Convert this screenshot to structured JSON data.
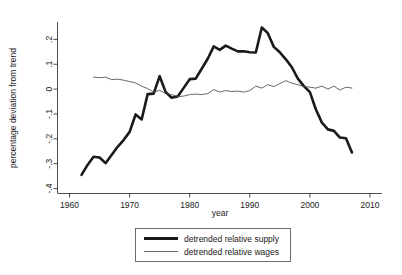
{
  "chart_data": {
    "type": "line",
    "title": "",
    "xlabel": "year",
    "ylabel": "percentage deviation from trend",
    "xlim": [
      1958,
      2012
    ],
    "ylim": [
      -0.42,
      0.27
    ],
    "xticks": [
      1960,
      1970,
      1980,
      1990,
      2000,
      2010
    ],
    "xtick_labels": [
      "1960",
      "1970",
      "1980",
      "1990",
      "2000",
      "2010"
    ],
    "yticks": [
      0.2,
      0.1,
      0,
      -0.1,
      -0.2,
      -0.3,
      -0.4
    ],
    "ytick_labels": [
      ".2",
      ".1",
      "0",
      "-.1",
      "-.2",
      "-.3",
      "-.4"
    ],
    "grid": false,
    "legend_position": "below",
    "series": [
      {
        "name": "detrended relative supply",
        "style": "thick",
        "color": "#1a1a1a",
        "x": [
          1962,
          1963,
          1964,
          1965,
          1966,
          1967,
          1968,
          1969,
          1970,
          1971,
          1972,
          1973,
          1974,
          1975,
          1976,
          1977,
          1978,
          1979,
          1980,
          1981,
          1982,
          1983,
          1984,
          1985,
          1986,
          1987,
          1988,
          1989,
          1990,
          1991,
          1992,
          1993,
          1994,
          1995,
          1996,
          1997,
          1998,
          1999,
          2000,
          2001,
          2002,
          2003,
          2004,
          2005,
          2006,
          2007
        ],
        "values": [
          -0.345,
          -0.305,
          -0.272,
          -0.275,
          -0.298,
          -0.265,
          -0.232,
          -0.205,
          -0.172,
          -0.102,
          -0.122,
          -0.02,
          -0.018,
          0.052,
          -0.012,
          -0.035,
          -0.03,
          0.005,
          0.04,
          0.042,
          0.082,
          0.122,
          0.172,
          0.158,
          0.175,
          0.163,
          0.152,
          0.152,
          0.148,
          0.147,
          0.248,
          0.225,
          0.17,
          0.148,
          0.12,
          0.088,
          0.042,
          0.012,
          -0.012,
          -0.082,
          -0.135,
          -0.162,
          -0.168,
          -0.195,
          -0.198,
          -0.255
        ]
      },
      {
        "name": "detrended relative wages",
        "style": "thin",
        "color": "#4a4a4a",
        "x": [
          1964,
          1965,
          1966,
          1967,
          1968,
          1969,
          1970,
          1971,
          1972,
          1973,
          1974,
          1975,
          1976,
          1977,
          1978,
          1979,
          1980,
          1981,
          1982,
          1983,
          1984,
          1985,
          1986,
          1987,
          1988,
          1989,
          1990,
          1991,
          1992,
          1993,
          1994,
          1995,
          1996,
          1997,
          1998,
          1999,
          2000,
          2001,
          2002,
          2003,
          2004,
          2005,
          2006,
          2007
        ],
        "values": [
          0.048,
          0.046,
          0.048,
          0.038,
          0.04,
          0.036,
          0.03,
          0.025,
          0.012,
          0.002,
          -0.012,
          -0.005,
          -0.018,
          -0.022,
          -0.03,
          -0.028,
          -0.022,
          -0.02,
          -0.022,
          -0.018,
          -0.002,
          -0.012,
          -0.006,
          -0.01,
          -0.008,
          -0.012,
          -0.006,
          0.012,
          0.004,
          0.018,
          0.01,
          0.022,
          0.034,
          0.024,
          0.018,
          0.01,
          0.008,
          0.004,
          0.012,
          0.0,
          0.012,
          -0.004,
          0.008,
          0.004
        ]
      }
    ]
  },
  "legend": {
    "items": [
      {
        "label": "detrended relative supply"
      },
      {
        "label": "detrended relative wages"
      }
    ]
  }
}
